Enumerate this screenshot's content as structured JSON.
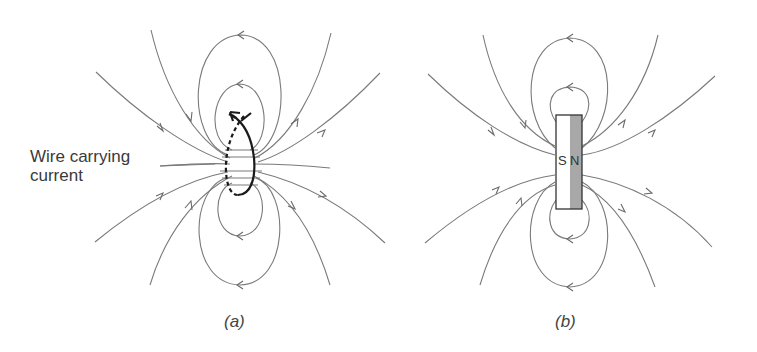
{
  "figure": {
    "panel_a": {
      "label": "Wire carrying\ncurrent",
      "label_line1": "Wire carrying",
      "label_line2": "current",
      "caption": "(a)"
    },
    "panel_b": {
      "pole_south": "S",
      "pole_north": "N",
      "caption": "(b)"
    }
  },
  "colors": {
    "field_line": "#7a7a7a",
    "wire": "#1a1a1a",
    "magnet_north_fill": "#a8a8a8",
    "magnet_south_fill": "#ffffff"
  }
}
